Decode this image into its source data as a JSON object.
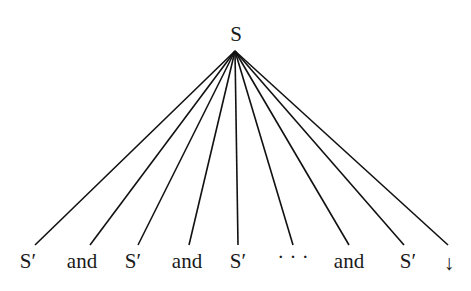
{
  "diagram": {
    "type": "tree",
    "root": {
      "label": "S",
      "x": 236,
      "y": 41
    },
    "apex": {
      "x": 235,
      "y": 51
    },
    "line_color": "#111111",
    "text_color": "#1a1a1a",
    "children": [
      {
        "label": "S′",
        "x": 28,
        "y": 268,
        "line_x": 35
      },
      {
        "label": "and",
        "x": 82,
        "y": 268,
        "line_x": 90
      },
      {
        "label": "S′",
        "x": 133,
        "y": 268,
        "line_x": 138
      },
      {
        "label": "and",
        "x": 187,
        "y": 268,
        "line_x": 189
      },
      {
        "label": "S′",
        "x": 238,
        "y": 268,
        "line_x": 238
      },
      {
        "label": "· · ·",
        "x": 293,
        "y": 264,
        "line_x": 293
      },
      {
        "label": "and",
        "x": 349,
        "y": 268,
        "line_x": 349
      },
      {
        "label": "S′",
        "x": 408,
        "y": 268,
        "line_x": 404
      },
      {
        "label": "↓",
        "x": 449,
        "y": 270,
        "line_x": 448
      }
    ]
  }
}
